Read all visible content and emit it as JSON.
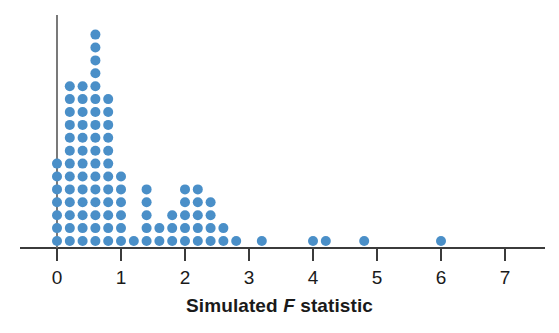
{
  "figure": {
    "kind": "dotplot",
    "background": "#ffffff",
    "dot_color": "#4a8fc8",
    "axis_color": "#3b3b3b",
    "text_color": "#1a1a1a"
  },
  "axis": {
    "label_prefix": "Simulated ",
    "label_italic": "F",
    "label_suffix": " statistic",
    "label_full": "Simulated F statistic",
    "ticks": [
      {
        "value": 0,
        "label": "0"
      },
      {
        "value": 1,
        "label": "1"
      },
      {
        "value": 2,
        "label": "2"
      },
      {
        "value": 3,
        "label": "3"
      },
      {
        "value": 4,
        "label": "4"
      },
      {
        "value": 5,
        "label": "5"
      },
      {
        "value": 6,
        "label": "6"
      },
      {
        "value": 7,
        "label": "7"
      }
    ]
  },
  "chart_data": {
    "type": "scatter",
    "title": "",
    "subtitle": "",
    "xlabel": "Simulated F statistic",
    "ylabel": "",
    "xlim": [
      -0.25,
      7.6
    ],
    "ylim": [
      0,
      18
    ],
    "grid": false,
    "legend": null,
    "annotations": [],
    "xticks": [
      0,
      1,
      2,
      3,
      4,
      5,
      6,
      7
    ],
    "xticklabels": [
      "0",
      "1",
      "2",
      "3",
      "4",
      "5",
      "6",
      "7"
    ],
    "bin_width": 0.2,
    "dot_stack_note": "Each dot represents one simulated F statistic; dots stack vertically within a bin.",
    "categories": [
      0.0,
      0.2,
      0.4,
      0.6,
      0.8,
      1.0,
      1.2,
      1.4,
      1.6,
      1.8,
      2.0,
      2.2,
      2.4,
      2.6,
      2.8,
      3.2,
      4.0,
      4.2,
      4.8,
      6.0
    ],
    "values": [
      7,
      13,
      13,
      17,
      12,
      6,
      1,
      5,
      2,
      3,
      5,
      5,
      4,
      2,
      1,
      1,
      1,
      1,
      1,
      1
    ],
    "total_dots": 102
  }
}
